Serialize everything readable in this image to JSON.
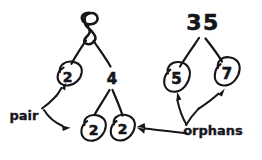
{
  "canvas": {
    "width": 262,
    "height": 160,
    "background": "#ffffff",
    "ink_color": "#16161a",
    "style": "hand-drawn-sketch"
  },
  "diagram": {
    "title_text": "",
    "trees": [
      {
        "id": "left-tree",
        "root_label": "8",
        "nodes": [
          {
            "id": "n8",
            "label": "8",
            "circled": false,
            "x": 90,
            "y": 28
          },
          {
            "id": "n2a",
            "label": "2",
            "circled": true,
            "x": 67,
            "y": 78
          },
          {
            "id": "n4",
            "label": "4",
            "circled": false,
            "x": 112,
            "y": 79
          },
          {
            "id": "n2b",
            "label": "2",
            "circled": true,
            "x": 92,
            "y": 131
          },
          {
            "id": "n2c",
            "label": "2",
            "circled": true,
            "x": 122,
            "y": 131
          }
        ],
        "edges": [
          {
            "from": "n8",
            "to": "n2a"
          },
          {
            "from": "n8",
            "to": "n4"
          },
          {
            "from": "n4",
            "to": "n2b"
          },
          {
            "from": "n4",
            "to": "n2c"
          }
        ]
      },
      {
        "id": "right-tree",
        "root_label": "35",
        "nodes": [
          {
            "id": "n35",
            "label": "35",
            "circled": false,
            "x": 203,
            "y": 24
          },
          {
            "id": "n5",
            "label": "5",
            "circled": true,
            "x": 175,
            "y": 81
          },
          {
            "id": "n7",
            "label": "7",
            "circled": true,
            "x": 226,
            "y": 76
          }
        ],
        "edges": [
          {
            "from": "n35",
            "to": "n5"
          },
          {
            "from": "n35",
            "to": "n7"
          }
        ]
      }
    ],
    "annotations": [
      {
        "id": "pair-annotation",
        "label": "pair",
        "label_x": 24,
        "label_y": 116,
        "arrow_kind": "forked",
        "targets": [
          "n2a",
          "n2b"
        ]
      },
      {
        "id": "orphans-annotation",
        "label": "orphans",
        "label_x": 213,
        "label_y": 131,
        "arrow_kind": "forked-plus-straight",
        "targets": [
          "n5",
          "n7",
          "n2c"
        ]
      }
    ]
  }
}
